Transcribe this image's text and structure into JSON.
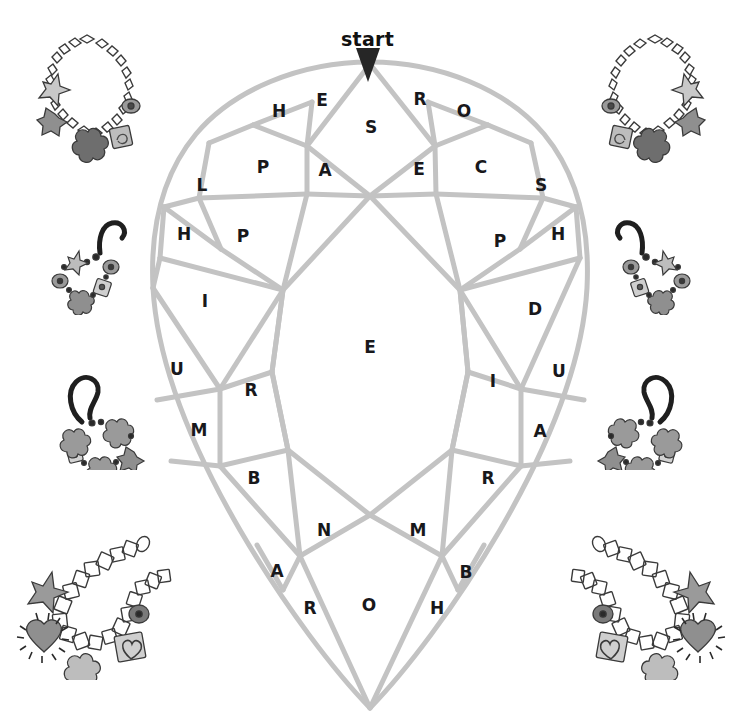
{
  "page": {
    "width": 735,
    "height": 725,
    "background_color": "#ffffff"
  },
  "colors": {
    "facet_line": "#c3c3c3",
    "letter": "#18181b",
    "arrow": "#262626",
    "deco_outline": "#3a3a3a",
    "deco_fill_light": "#d0d0d0",
    "deco_fill_mid": "#9a9a9a",
    "deco_fill_dark": "#6e6e6e"
  },
  "start_marker": {
    "label": "start",
    "icon": "down-arrow-icon",
    "x": 368,
    "y": 64
  },
  "gem": {
    "shape": "pear",
    "outline_color": "#c3c3c3",
    "line_width": 5,
    "center_letter": "E",
    "center_x": 370,
    "center_y": 347
  },
  "letters": [
    {
      "char": "E",
      "x": 322,
      "y": 100,
      "region": "crown-upper-left"
    },
    {
      "char": "H",
      "x": 279,
      "y": 111,
      "region": "crown-upper-left"
    },
    {
      "char": "R",
      "x": 420,
      "y": 99,
      "region": "crown-upper-right"
    },
    {
      "char": "O",
      "x": 464,
      "y": 111,
      "region": "crown-upper-right"
    },
    {
      "char": "S",
      "x": 371,
      "y": 127,
      "region": "table-top"
    },
    {
      "char": "P",
      "x": 263,
      "y": 167,
      "region": "crown-left"
    },
    {
      "char": "A",
      "x": 325,
      "y": 170,
      "region": "crown-left"
    },
    {
      "char": "E",
      "x": 419,
      "y": 169,
      "region": "crown-right"
    },
    {
      "char": "C",
      "x": 481,
      "y": 167,
      "region": "crown-right"
    },
    {
      "char": "L",
      "x": 202,
      "y": 185,
      "region": "girdle-left"
    },
    {
      "char": "S",
      "x": 541,
      "y": 185,
      "region": "girdle-right"
    },
    {
      "char": "H",
      "x": 184,
      "y": 234,
      "region": "girdle-left"
    },
    {
      "char": "P",
      "x": 243,
      "y": 236,
      "region": "pavilion-upper-left"
    },
    {
      "char": "P",
      "x": 500,
      "y": 241,
      "region": "pavilion-upper-right"
    },
    {
      "char": "H",
      "x": 558,
      "y": 234,
      "region": "girdle-right"
    },
    {
      "char": "I",
      "x": 205,
      "y": 301,
      "region": "pavilion-left"
    },
    {
      "char": "D",
      "x": 535,
      "y": 309,
      "region": "pavilion-right"
    },
    {
      "char": "E",
      "x": 370,
      "y": 347,
      "region": "center"
    },
    {
      "char": "U",
      "x": 177,
      "y": 369,
      "region": "pavilion-left"
    },
    {
      "char": "R",
      "x": 251,
      "y": 390,
      "region": "pavilion-left"
    },
    {
      "char": "I",
      "x": 493,
      "y": 381,
      "region": "pavilion-right"
    },
    {
      "char": "U",
      "x": 559,
      "y": 371,
      "region": "pavilion-right"
    },
    {
      "char": "M",
      "x": 199,
      "y": 430,
      "region": "pavilion-lower-left"
    },
    {
      "char": "A",
      "x": 540,
      "y": 431,
      "region": "pavilion-lower-right"
    },
    {
      "char": "B",
      "x": 254,
      "y": 478,
      "region": "pavilion-lower-left"
    },
    {
      "char": "R",
      "x": 488,
      "y": 478,
      "region": "pavilion-lower-right"
    },
    {
      "char": "N",
      "x": 324,
      "y": 530,
      "region": "culet-left"
    },
    {
      "char": "M",
      "x": 418,
      "y": 530,
      "region": "culet-right"
    },
    {
      "char": "A",
      "x": 277,
      "y": 571,
      "region": "culet-left"
    },
    {
      "char": "B",
      "x": 466,
      "y": 572,
      "region": "culet-right"
    },
    {
      "char": "R",
      "x": 310,
      "y": 608,
      "region": "culet-bottom"
    },
    {
      "char": "O",
      "x": 369,
      "y": 605,
      "region": "culet-bottom"
    },
    {
      "char": "H",
      "x": 437,
      "y": 608,
      "region": "culet-bottom"
    }
  ],
  "decorations": [
    {
      "name": "charm-bracelet-chain",
      "position": "top-left",
      "x": 25,
      "y": 28,
      "width": 125,
      "height": 135,
      "flipped": false
    },
    {
      "name": "charm-bracelet-chain",
      "position": "top-right",
      "x": 592,
      "y": 28,
      "width": 125,
      "height": 135,
      "flipped": true
    },
    {
      "name": "beaded-hook-bracelet",
      "position": "middle-left",
      "x": 48,
      "y": 205,
      "width": 100,
      "height": 110,
      "flipped": false
    },
    {
      "name": "beaded-hook-bracelet",
      "position": "middle-right",
      "x": 594,
      "y": 205,
      "width": 100,
      "height": 110,
      "flipped": true
    },
    {
      "name": "flower-hook-bracelet",
      "position": "lower-left",
      "x": 48,
      "y": 360,
      "width": 100,
      "height": 110,
      "flipped": false
    },
    {
      "name": "flower-hook-bracelet",
      "position": "lower-right",
      "x": 594,
      "y": 360,
      "width": 100,
      "height": 110,
      "flipped": true
    },
    {
      "name": "square-link-charm-bracelet",
      "position": "bottom-left",
      "x": 12,
      "y": 530,
      "width": 165,
      "height": 150,
      "flipped": false
    },
    {
      "name": "square-link-charm-bracelet",
      "position": "bottom-right",
      "x": 565,
      "y": 530,
      "width": 165,
      "height": 150,
      "flipped": true
    }
  ]
}
